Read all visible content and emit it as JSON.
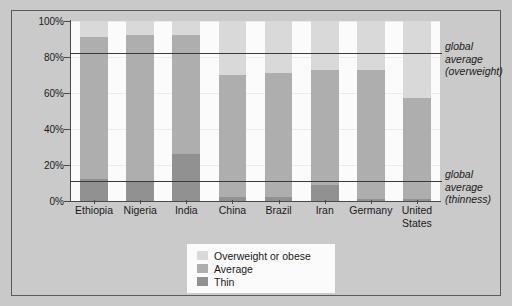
{
  "chart_data": {
    "type": "bar",
    "subtype": "stacked-percentage",
    "title": "",
    "subtitle": "",
    "xlabel": "",
    "ylabel": "",
    "ylim": [
      0,
      100
    ],
    "grid": true,
    "legend_position": "bottom-center",
    "categories": [
      "Ethiopia",
      "Nigeria",
      "India",
      "China",
      "Brazil",
      "Iran",
      "Germany",
      "United States"
    ],
    "ytick_labels": [
      "100%",
      "80%",
      "60%",
      "40%",
      "20%",
      "0%"
    ],
    "ytick_values": [
      100,
      80,
      60,
      40,
      20,
      0
    ],
    "series": [
      {
        "name": "Thin",
        "color": "#919191",
        "values": [
          12,
          11,
          26,
          2,
          2,
          9,
          1,
          1
        ]
      },
      {
        "name": "Average",
        "color": "#aeaeae",
        "values": [
          79,
          81,
          66,
          68,
          69,
          64,
          72,
          56
        ]
      },
      {
        "name": "Overweight or obese",
        "color": "#d9d9d9",
        "values": [
          9,
          8,
          8,
          30,
          29,
          27,
          27,
          43
        ]
      }
    ],
    "stack_tops": {
      "thin": [
        12,
        11,
        26,
        2,
        2,
        9,
        1,
        1
      ],
      "average": [
        91,
        92,
        92,
        70,
        71,
        73,
        73,
        57
      ]
    },
    "reference_lines": [
      {
        "id": "overweight",
        "value": 82,
        "label_lines": [
          "global",
          "average",
          "(overweight)"
        ]
      },
      {
        "id": "thinness",
        "value": 11,
        "label_lines": [
          "global",
          "average",
          "(thinness)"
        ]
      }
    ]
  },
  "legend": {
    "items": [
      {
        "label": "Overweight or obese",
        "color": "#d9d9d9"
      },
      {
        "label": "Average",
        "color": "#aeaeae"
      },
      {
        "label": "Thin",
        "color": "#919191"
      }
    ]
  },
  "colors": {
    "page_background": "#c9c9c9",
    "plot_background": "#fbfbfb",
    "axis": "#4a4a4a",
    "reference_line": "#3a3a3a",
    "text": "#1a1a1a"
  }
}
